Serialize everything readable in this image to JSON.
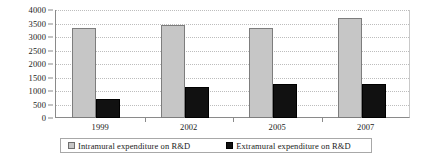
{
  "chart_data": {
    "type": "bar",
    "title": "",
    "subtitle": "",
    "xlabel": "",
    "ylabel": "",
    "categories": [
      "1999",
      "2002",
      "2005",
      "2007"
    ],
    "series": [
      {
        "name": "Intramural expenditure on R&D",
        "color": "#c6c6c6",
        "values": [
          3350,
          3450,
          3350,
          3700
        ]
      },
      {
        "name": "Extramural expenditure on R&D",
        "color": "#111111",
        "values": [
          700,
          1150,
          1270,
          1270
        ]
      }
    ],
    "ylim": [
      0,
      4000
    ],
    "ytick_values": [
      0,
      500,
      1000,
      1500,
      2000,
      2500,
      3000,
      3500,
      4000
    ],
    "ytick_labels": [
      "0",
      "500",
      "1000",
      "1500",
      "2000",
      "2500",
      "3000",
      "3500",
      "4000"
    ],
    "grid": true,
    "grid_style": "dotted",
    "legend_position": "bottom",
    "annotations": []
  },
  "legend": {
    "entries": [
      {
        "label": "Intramural expenditure on R&D",
        "swatch": "intramural"
      },
      {
        "label": "Extramural expenditure on R&D",
        "swatch": "extramural"
      }
    ]
  },
  "colors": {
    "intramural": "#c6c6c6",
    "extramural": "#111111",
    "grid": "#bdbdbd",
    "axis": "#8a8a8a",
    "text": "#1a1a1a"
  }
}
